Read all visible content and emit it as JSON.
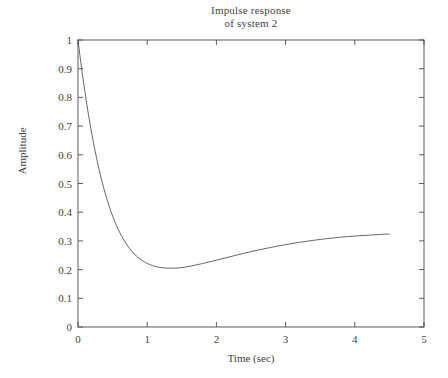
{
  "chart_data": {
    "type": "line",
    "title": "Impulse response of system 2",
    "title_lines": [
      "Impulse response",
      "of system 2"
    ],
    "xlabel": "Time (sec)",
    "ylabel": "Amplitude",
    "xlim": [
      0,
      5
    ],
    "ylim": [
      0,
      1
    ],
    "xticks": [
      0,
      1,
      2,
      3,
      4,
      5
    ],
    "xtick_labels": [
      "0",
      "1",
      "2",
      "3",
      "4",
      "5"
    ],
    "yticks": [
      0,
      0.1,
      0.2,
      0.3,
      0.4,
      0.5,
      0.6,
      0.7,
      0.8,
      0.9,
      1
    ],
    "ytick_labels": [
      "0",
      "0.1",
      "0.2",
      "0.3",
      "0.4",
      "0.5",
      "0.6",
      "0.7",
      "0.8",
      "0.9",
      "1"
    ],
    "grid": false,
    "legend": null,
    "line_color": "#555555",
    "series": [
      {
        "name": "impulse response",
        "x": [
          0.0,
          0.05,
          0.1,
          0.15,
          0.2,
          0.25,
          0.3,
          0.35,
          0.4,
          0.45,
          0.5,
          0.55,
          0.6,
          0.65,
          0.7,
          0.75,
          0.8,
          0.85,
          0.9,
          0.95,
          1.0,
          1.1,
          1.2,
          1.3,
          1.4,
          1.5,
          1.6,
          1.7,
          1.8,
          1.9,
          2.0,
          2.2,
          2.4,
          2.6,
          2.8,
          3.0,
          3.2,
          3.4,
          3.6,
          3.8,
          4.0,
          4.2,
          4.4,
          4.5
        ],
        "y": [
          1.0,
          0.905,
          0.82,
          0.742,
          0.672,
          0.61,
          0.554,
          0.504,
          0.46,
          0.421,
          0.387,
          0.357,
          0.331,
          0.308,
          0.289,
          0.272,
          0.258,
          0.246,
          0.236,
          0.228,
          0.222,
          0.212,
          0.207,
          0.205,
          0.205,
          0.207,
          0.211,
          0.216,
          0.221,
          0.227,
          0.233,
          0.245,
          0.257,
          0.268,
          0.278,
          0.287,
          0.295,
          0.302,
          0.308,
          0.313,
          0.317,
          0.32,
          0.323,
          0.324
        ]
      }
    ],
    "annotations": {
      "minimum": {
        "x": 0.97,
        "y": 0.205
      },
      "start": {
        "x": 0.0,
        "y": 1.0
      },
      "end": {
        "x": 4.5,
        "y": 0.324
      }
    }
  },
  "axes": {
    "box_color": "#4a4a4a"
  }
}
